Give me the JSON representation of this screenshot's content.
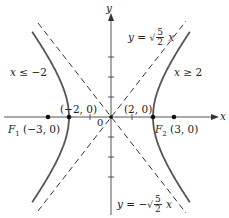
{
  "diagram": {
    "axes": {
      "x_label": "x",
      "y_label": "y",
      "origin_label": "0"
    },
    "origin_px": [
      111,
      117
    ],
    "unit_px": {
      "x": 21,
      "y": 24
    },
    "colors": {
      "curve": "#555555",
      "axis": "#555555",
      "asymptote": "#333333",
      "point": "#111111",
      "text": "#222222"
    },
    "branches": [
      {
        "name": "left",
        "region_label": "x ≤ −2"
      },
      {
        "name": "right",
        "region_label": "x ≥ 2"
      }
    ],
    "asymptotes": [
      {
        "lhs": "y = ",
        "sign": "",
        "num": "5",
        "den": "2",
        "var": "x"
      },
      {
        "lhs": "y = ",
        "sign": "−",
        "num": "5",
        "den": "2",
        "var": "x"
      }
    ],
    "points": [
      {
        "name": "F1",
        "label_main": "F",
        "label_sub": "1",
        "coords": "(−3, 0)",
        "x": -3,
        "y": 0
      },
      {
        "name": "F2",
        "label_main": "F",
        "label_sub": "2",
        "coords": "(3, 0)",
        "x": 3,
        "y": 0
      },
      {
        "name": "vertex-left",
        "coords": "(−2, 0)",
        "x": -2,
        "y": 0
      },
      {
        "name": "vertex-right",
        "coords": "(2, 0)",
        "x": 2,
        "y": 0
      }
    ]
  }
}
